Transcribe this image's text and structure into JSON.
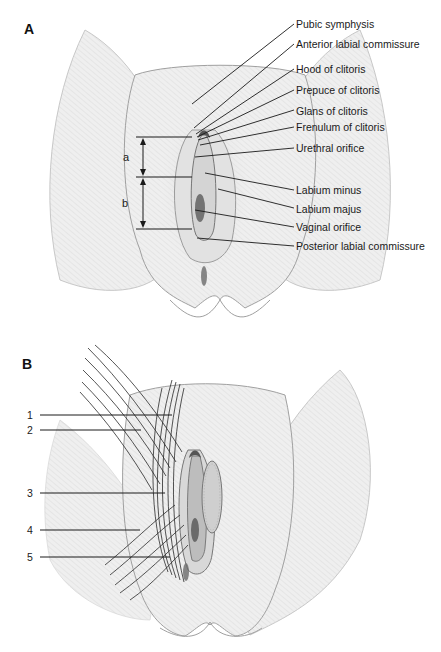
{
  "panel_a": {
    "letter": "A",
    "dimensions": {
      "a": "a",
      "b": "b"
    },
    "labels": [
      "Pubic symphysis",
      "Anterior labial commissure",
      "Hood of clitoris",
      "Prepuce of clitoris",
      "Glans of clitoris",
      "Frenulum of clitoris",
      "Urethral orifice",
      "Labium minus",
      "Labium majus",
      "Vaginal orifice",
      "Posterior labial commissure"
    ]
  },
  "panel_b": {
    "letter": "B",
    "numbers": [
      "1",
      "2",
      "3",
      "4",
      "5"
    ]
  },
  "colors": {
    "skin_fill": "#eeeeee",
    "outline": "#9a9a9a",
    "line": "#1a1a1a",
    "text": "#1a1a1a"
  }
}
